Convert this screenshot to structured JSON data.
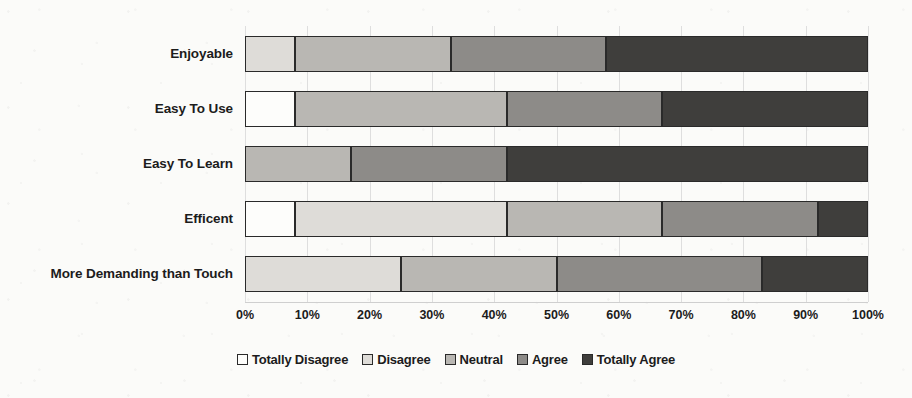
{
  "chart_data": {
    "type": "bar",
    "orientation": "horizontal",
    "stacked": true,
    "normalized": "100%",
    "title": "",
    "xlabel": "",
    "ylabel": "",
    "xlim": [
      0,
      100
    ],
    "grid": true,
    "legend_position": "bottom",
    "categories": [
      "Enjoyable",
      "Easy To Use",
      "Easy To Learn",
      "Efficent",
      "More Demanding than Touch"
    ],
    "tick_labels": [
      "0%",
      "10%",
      "20%",
      "30%",
      "40%",
      "50%",
      "60%",
      "70%",
      "80%",
      "90%",
      "100%"
    ],
    "tick_values": [
      0,
      10,
      20,
      30,
      40,
      50,
      60,
      70,
      80,
      90,
      100
    ],
    "series": [
      {
        "name": "Totally Disagree",
        "color": "#fdfdfb",
        "values": [
          0,
          8,
          0,
          8,
          0
        ]
      },
      {
        "name": "Disagree",
        "color": "#dedcd8",
        "values": [
          8,
          0,
          0,
          34,
          25
        ]
      },
      {
        "name": "Neutral",
        "color": "#b9b7b3",
        "values": [
          25,
          34,
          17,
          25,
          25
        ]
      },
      {
        "name": "Agree",
        "color": "#8d8b88",
        "values": [
          25,
          25,
          25,
          25,
          33
        ]
      },
      {
        "name": "Totally Agree",
        "color": "#3f3e3c",
        "values": [
          42,
          33,
          58,
          8,
          17
        ]
      }
    ]
  }
}
